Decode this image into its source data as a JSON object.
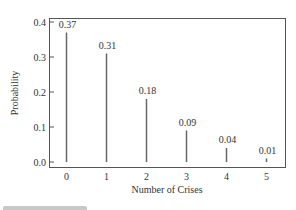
{
  "chart_data": {
    "type": "bar",
    "style": "stem",
    "title": "",
    "xlabel": "Number of Crises",
    "ylabel": "Probability",
    "categories": [
      "0",
      "1",
      "2",
      "3",
      "4",
      "5"
    ],
    "values": [
      0.37,
      0.31,
      0.18,
      0.09,
      0.04,
      0.01
    ],
    "value_labels": [
      "0.37",
      "0.31",
      "0.18",
      "0.09",
      "0.04",
      "0.01"
    ],
    "yticks": [
      "0.0",
      "0.1",
      "0.2",
      "0.3",
      "0.4"
    ],
    "ylim": [
      0,
      0.4
    ],
    "grid": false,
    "legend": null,
    "line_color": "#666666"
  }
}
